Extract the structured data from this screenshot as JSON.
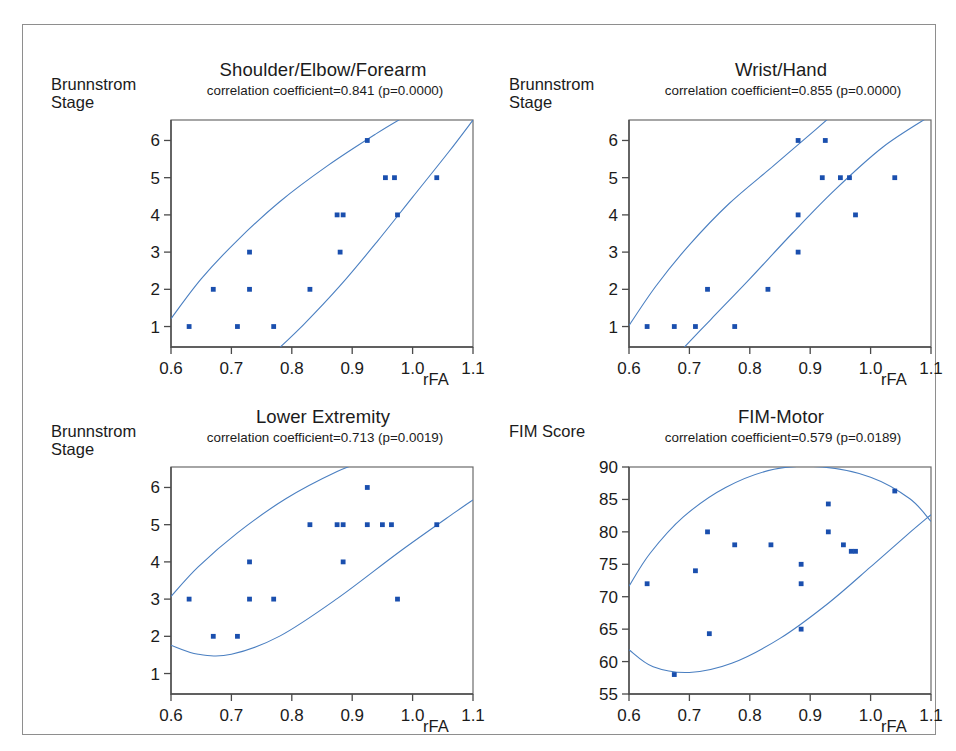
{
  "figure": {
    "border_color": "#8e8e8e",
    "background": "#ffffff",
    "point_color": "#1a4fae",
    "curve_color": "#4a7fc1"
  },
  "panels": [
    {
      "id": "shoulder-elbow-forearm",
      "title": "Shoulder/Elbow/Forearm",
      "subtitle": "correlation coefficient=0.841 (p=0.0000)",
      "ylabel_lines": [
        "Brunnstrom",
        "Stage"
      ],
      "xlabel": "rFA"
    },
    {
      "id": "wrist-hand",
      "title": "Wrist/Hand",
      "subtitle": "correlation coefficient=0.855 (p=0.0000)",
      "ylabel_lines": [
        "Brunnstrom",
        "Stage"
      ],
      "xlabel": "rFA"
    },
    {
      "id": "lower-extremity",
      "title": "Lower Extremity",
      "subtitle": "correlation coefficient=0.713 (p=0.0019)",
      "ylabel_lines": [
        "Brunnstrom",
        "Stage"
      ],
      "xlabel": "rFA"
    },
    {
      "id": "fim-motor",
      "title": "FIM-Motor",
      "subtitle": "correlation coefficient=0.579 (p=0.0189)",
      "ylabel_lines": [
        "FIM Score"
      ],
      "xlabel": "rFA"
    }
  ],
  "chart_data": [
    {
      "type": "scatter",
      "title": "Shoulder/Elbow/Forearm",
      "subtitle": "correlation coefficient=0.841 (p=0.0000)",
      "correlation_coefficient": 0.841,
      "p_value": "0.0000",
      "xlabel": "rFA",
      "ylabel": "Brunnstrom Stage",
      "xlim": [
        0.6,
        1.1
      ],
      "ylim": [
        0.45,
        6.55
      ],
      "xticks": [
        0.6,
        0.7,
        0.8,
        0.9,
        1.0,
        1.1
      ],
      "xticklabels": [
        "0.6",
        "0.7",
        "0.8",
        "0.9",
        "1.0",
        "1.1"
      ],
      "yticks": [
        1,
        2,
        3,
        4,
        5,
        6
      ],
      "yticklabels": [
        "1",
        "2",
        "3",
        "4",
        "5",
        "6"
      ],
      "grid": false,
      "legend": "none",
      "confidence_ellipse": true,
      "points": [
        {
          "x": 0.63,
          "y": 1
        },
        {
          "x": 0.71,
          "y": 1
        },
        {
          "x": 0.77,
          "y": 1
        },
        {
          "x": 0.67,
          "y": 2
        },
        {
          "x": 0.73,
          "y": 2
        },
        {
          "x": 0.83,
          "y": 2
        },
        {
          "x": 0.73,
          "y": 3
        },
        {
          "x": 0.88,
          "y": 3
        },
        {
          "x": 0.875,
          "y": 4
        },
        {
          "x": 0.885,
          "y": 4
        },
        {
          "x": 0.975,
          "y": 4
        },
        {
          "x": 0.955,
          "y": 5
        },
        {
          "x": 0.97,
          "y": 5
        },
        {
          "x": 1.04,
          "y": 5
        },
        {
          "x": 0.925,
          "y": 6
        }
      ]
    },
    {
      "type": "scatter",
      "title": "Wrist/Hand",
      "subtitle": "correlation coefficient=0.855 (p=0.0000)",
      "correlation_coefficient": 0.855,
      "p_value": "0.0000",
      "xlabel": "rFA",
      "ylabel": "Brunnstrom Stage",
      "xlim": [
        0.6,
        1.1
      ],
      "ylim": [
        0.45,
        6.55
      ],
      "xticks": [
        0.6,
        0.7,
        0.8,
        0.9,
        1.0,
        1.1
      ],
      "xticklabels": [
        "0.6",
        "0.7",
        "0.8",
        "0.9",
        "1.0",
        "1.1"
      ],
      "yticks": [
        1,
        2,
        3,
        4,
        5,
        6
      ],
      "yticklabels": [
        "1",
        "2",
        "3",
        "4",
        "5",
        "6"
      ],
      "grid": false,
      "legend": "none",
      "confidence_ellipse": true,
      "points": [
        {
          "x": 0.63,
          "y": 1
        },
        {
          "x": 0.675,
          "y": 1
        },
        {
          "x": 0.71,
          "y": 1
        },
        {
          "x": 0.775,
          "y": 1
        },
        {
          "x": 0.73,
          "y": 2
        },
        {
          "x": 0.83,
          "y": 2
        },
        {
          "x": 0.88,
          "y": 3
        },
        {
          "x": 0.88,
          "y": 4
        },
        {
          "x": 0.975,
          "y": 4
        },
        {
          "x": 0.92,
          "y": 5
        },
        {
          "x": 0.95,
          "y": 5
        },
        {
          "x": 0.965,
          "y": 5
        },
        {
          "x": 1.04,
          "y": 5
        },
        {
          "x": 0.88,
          "y": 6
        },
        {
          "x": 0.925,
          "y": 6
        }
      ]
    },
    {
      "type": "scatter",
      "title": "Lower Extremity",
      "subtitle": "correlation coefficient=0.713 (p=0.0019)",
      "correlation_coefficient": 0.713,
      "p_value": "0.0019",
      "xlabel": "rFA",
      "ylabel": "Brunnstrom Stage",
      "xlim": [
        0.6,
        1.1
      ],
      "ylim": [
        0.45,
        6.55
      ],
      "xticks": [
        0.6,
        0.7,
        0.8,
        0.9,
        1.0,
        1.1
      ],
      "xticklabels": [
        "0.6",
        "0.7",
        "0.8",
        "0.9",
        "1.0",
        "1.1"
      ],
      "yticks": [
        1,
        2,
        3,
        4,
        5,
        6
      ],
      "yticklabels": [
        "1",
        "2",
        "3",
        "4",
        "5",
        "6"
      ],
      "grid": false,
      "legend": "none",
      "confidence_ellipse": true,
      "points": [
        {
          "x": 0.67,
          "y": 2
        },
        {
          "x": 0.71,
          "y": 2
        },
        {
          "x": 0.63,
          "y": 3
        },
        {
          "x": 0.73,
          "y": 3
        },
        {
          "x": 0.77,
          "y": 3
        },
        {
          "x": 0.975,
          "y": 3
        },
        {
          "x": 0.73,
          "y": 4
        },
        {
          "x": 0.885,
          "y": 4
        },
        {
          "x": 0.83,
          "y": 5
        },
        {
          "x": 0.875,
          "y": 5
        },
        {
          "x": 0.885,
          "y": 5
        },
        {
          "x": 0.925,
          "y": 5
        },
        {
          "x": 0.95,
          "y": 5
        },
        {
          "x": 0.965,
          "y": 5
        },
        {
          "x": 1.04,
          "y": 5
        },
        {
          "x": 0.925,
          "y": 6
        }
      ]
    },
    {
      "type": "scatter",
      "title": "FIM-Motor",
      "subtitle": "correlation coefficient=0.579 (p=0.0189)",
      "correlation_coefficient": 0.579,
      "p_value": "0.0189",
      "xlabel": "rFA",
      "ylabel": "FIM Score",
      "xlim": [
        0.6,
        1.1
      ],
      "ylim": [
        55,
        90
      ],
      "xticks": [
        0.6,
        0.7,
        0.8,
        0.9,
        1.0,
        1.1
      ],
      "xticklabels": [
        "0.6",
        "0.7",
        "0.8",
        "0.9",
        "1.0",
        "1.1"
      ],
      "yticks": [
        55,
        60,
        65,
        70,
        75,
        80,
        85,
        90
      ],
      "yticklabels": [
        "55",
        "60",
        "65",
        "70",
        "75",
        "80",
        "85",
        "90"
      ],
      "grid": false,
      "legend": "none",
      "confidence_ellipse": true,
      "points": [
        {
          "x": 0.63,
          "y": 72
        },
        {
          "x": 0.675,
          "y": 58
        },
        {
          "x": 0.71,
          "y": 74
        },
        {
          "x": 0.73,
          "y": 80
        },
        {
          "x": 0.733,
          "y": 64.3
        },
        {
          "x": 0.775,
          "y": 78
        },
        {
          "x": 0.835,
          "y": 78
        },
        {
          "x": 0.885,
          "y": 75
        },
        {
          "x": 0.885,
          "y": 72
        },
        {
          "x": 0.885,
          "y": 65
        },
        {
          "x": 0.93,
          "y": 84.3
        },
        {
          "x": 0.93,
          "y": 80
        },
        {
          "x": 0.955,
          "y": 78
        },
        {
          "x": 0.968,
          "y": 77
        },
        {
          "x": 0.975,
          "y": 77
        },
        {
          "x": 1.04,
          "y": 86.3
        }
      ]
    }
  ]
}
